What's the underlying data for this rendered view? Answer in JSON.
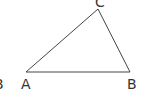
{
  "diagram": {
    "type": "triangle",
    "stroke_color": "#444444",
    "label_color": "#333333",
    "vertices": {
      "A": {
        "x": 26,
        "y": 72
      },
      "B": {
        "x": 130,
        "y": 72
      },
      "C": {
        "x": 98,
        "y": 9
      }
    },
    "labels": {
      "A": "A",
      "B": "B",
      "C": "C",
      "cut_off_left": "B"
    }
  }
}
